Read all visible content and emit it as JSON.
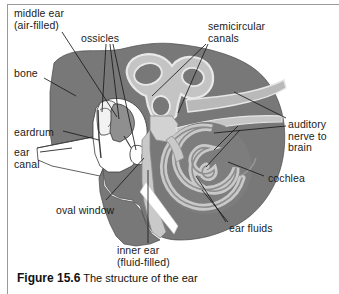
{
  "figure": {
    "caption_label": "Figure 15.6",
    "caption_text": " The structure of the ear",
    "title": "The structure of the ear"
  },
  "colors": {
    "bone_fill": "#787878",
    "bone_fill_dark": "#6f6f6f",
    "canal_light": "#c9c9c9",
    "cavity_white": "#ffffff",
    "ossicle_light": "#e8e8e8",
    "outline": "#3a3a3a",
    "leader_line": "#1b1b1b",
    "text": "#1b1b1b",
    "page_rule": "#9a9a9a",
    "background": "#ffffff"
  },
  "labels": [
    {
      "id": "middle-ear",
      "line1": "middle ear",
      "line2": "(air-filled)",
      "x": 14,
      "y": 8,
      "align": "left"
    },
    {
      "id": "ossicles",
      "line1": "ossicles",
      "line2": "",
      "x": 81,
      "y": 33,
      "align": "left"
    },
    {
      "id": "semicircular-canals",
      "line1": "semicircular",
      "line2": "canals",
      "x": 208,
      "y": 21,
      "align": "left"
    },
    {
      "id": "bone",
      "line1": "bone",
      "line2": "",
      "x": 14,
      "y": 68,
      "align": "left"
    },
    {
      "id": "auditory-nerve",
      "line1": "auditory",
      "line2": "nerve to",
      "line3": "brain",
      "x": 288,
      "y": 119,
      "align": "left"
    },
    {
      "id": "eardrum",
      "line1": "eardrum",
      "line2": "",
      "x": 14,
      "y": 127,
      "align": "left"
    },
    {
      "id": "ear-canal",
      "line1": "ear",
      "line2": "canal",
      "x": 14,
      "y": 147,
      "align": "left"
    },
    {
      "id": "cochlea",
      "line1": "cochlea",
      "line2": "",
      "x": 268,
      "y": 173,
      "align": "left"
    },
    {
      "id": "oval-window",
      "line1": "oval window",
      "line2": "",
      "x": 56,
      "y": 205,
      "align": "left"
    },
    {
      "id": "ear-fluids",
      "line1": "ear fluids",
      "line2": "",
      "x": 229,
      "y": 223,
      "align": "left"
    },
    {
      "id": "inner-ear",
      "line1": "inner ear",
      "line2": "(fluid-filled)",
      "x": 117,
      "y": 245,
      "align": "left"
    }
  ],
  "anatomy_parts": [
    {
      "name": "bone",
      "description": "temporal bone mass, mid-gray silhouette"
    },
    {
      "name": "middle-ear-cavity",
      "description": "air-filled white cavity around ossicles"
    },
    {
      "name": "ossicles",
      "description": "three small light bones: malleus, incus, stapes"
    },
    {
      "name": "eardrum",
      "description": "tympanic membrane separating canal and middle ear"
    },
    {
      "name": "ear-canal",
      "description": "white wedge-shaped outer auditory canal"
    },
    {
      "name": "oval-window",
      "description": "opening from stapes into inner ear"
    },
    {
      "name": "semicircular-canals",
      "description": "three light-gray looped tubes, upper region"
    },
    {
      "name": "cochlea",
      "description": "light-gray spiral, two-and-a-half turns"
    },
    {
      "name": "ear-fluids",
      "description": "fluid inside cochlea and canals"
    },
    {
      "name": "auditory-nerve",
      "description": "nerve band running to brain, upper right"
    }
  ]
}
